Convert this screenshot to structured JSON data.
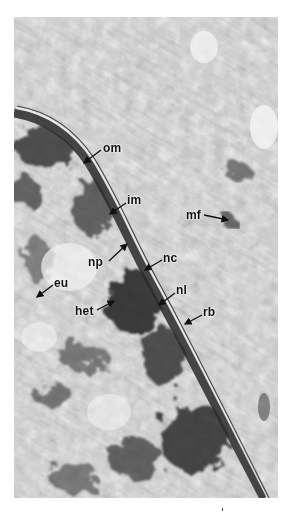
{
  "figure": {
    "type": "electron-micrograph",
    "colors": {
      "background": "#ffffff",
      "texture_light": "#e6e6e6",
      "texture_dark": "#2a2a2a",
      "membrane": "#3a3a3a"
    }
  },
  "labels": [
    {
      "id": "om",
      "text": "om",
      "x": 103,
      "y": 142,
      "arrow": [
        101,
        150,
        84,
        163
      ]
    },
    {
      "id": "im",
      "text": "im",
      "x": 127,
      "y": 194,
      "arrow": [
        126,
        203,
        110,
        214
      ]
    },
    {
      "id": "mf",
      "text": "mf",
      "x": 186,
      "y": 209,
      "arrow": [
        204,
        215,
        228,
        220
      ]
    },
    {
      "id": "np",
      "text": "np",
      "x": 88,
      "y": 256,
      "arrow": [
        109,
        261,
        127,
        244
      ]
    },
    {
      "id": "nc",
      "text": "nc",
      "x": 163,
      "y": 252,
      "arrow": [
        162,
        260,
        145,
        270
      ]
    },
    {
      "id": "eu",
      "text": "eu",
      "x": 54,
      "y": 277,
      "arrow": [
        53,
        285,
        37,
        297
      ]
    },
    {
      "id": "nl",
      "text": "nl",
      "x": 176,
      "y": 284,
      "arrow": [
        175,
        293,
        159,
        305
      ]
    },
    {
      "id": "het",
      "text": "het",
      "x": 75,
      "y": 305,
      "arrow": [
        97,
        310,
        114,
        301
      ]
    },
    {
      "id": "rb",
      "text": "rb",
      "x": 203,
      "y": 306,
      "arrow": [
        202,
        315,
        185,
        324
      ]
    }
  ]
}
